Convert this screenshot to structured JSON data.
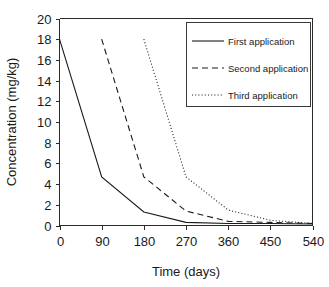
{
  "chart_data": {
    "type": "line",
    "title": "",
    "xlabel": "Time (days)",
    "ylabel": "Concentration (mg/kg)",
    "xlim": [
      0,
      540
    ],
    "ylim": [
      0,
      20
    ],
    "xticks": [
      0,
      90,
      180,
      270,
      360,
      450,
      540
    ],
    "yticks": [
      0,
      2,
      4,
      6,
      8,
      10,
      12,
      14,
      16,
      18,
      20
    ],
    "xtick_labels": [
      "0",
      "90",
      "180",
      "270",
      "360",
      "450",
      "540"
    ],
    "ytick_labels": [
      "0",
      "2",
      "4",
      "6",
      "8",
      "10",
      "12",
      "14",
      "16",
      "18",
      "20"
    ],
    "grid": false,
    "legend_position": "upper right",
    "series": [
      {
        "name": "First application",
        "style": "solid",
        "color": "#1a1a1a",
        "x": [
          0,
          90,
          180,
          270,
          360,
          450,
          540
        ],
        "y": [
          18.0,
          4.7,
          1.3,
          0.3,
          0.2,
          0.2,
          0.15
        ]
      },
      {
        "name": "Second application",
        "style": "dashed",
        "color": "#1a1a1a",
        "x": [
          90,
          180,
          270,
          360,
          450,
          540
        ],
        "y": [
          18.0,
          4.7,
          1.4,
          0.4,
          0.3,
          0.2
        ]
      },
      {
        "name": "Third application",
        "style": "dotted",
        "color": "#1a1a1a",
        "x": [
          180,
          270,
          360,
          450,
          540
        ],
        "y": [
          18.0,
          4.7,
          1.5,
          0.5,
          0.2
        ]
      }
    ]
  },
  "legend": {
    "entries": [
      {
        "label": "First application"
      },
      {
        "label": "Second application"
      },
      {
        "label": "Third application"
      }
    ]
  },
  "axes": {
    "x_title": "Time (days)",
    "y_title": "Concentration (mg/kg)"
  }
}
